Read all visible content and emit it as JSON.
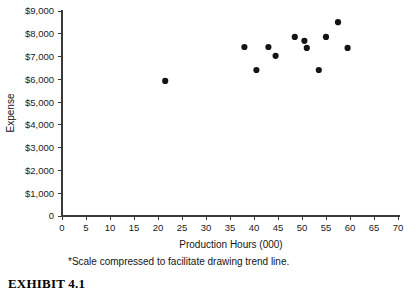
{
  "chart_data": {
    "type": "scatter",
    "title": "",
    "xlabel": "Production Hours (000)",
    "ylabel": "Expense",
    "xlim": [
      0,
      70
    ],
    "ylim": [
      0,
      9000
    ],
    "grid": false,
    "legend": null,
    "x_ticks": [
      0,
      5,
      10,
      15,
      20,
      25,
      30,
      35,
      40,
      45,
      50,
      55,
      60,
      65,
      70
    ],
    "x_tick_labels": [
      "0",
      "5",
      "10",
      "15",
      "20",
      "25",
      "30",
      "35",
      "40",
      "45",
      "50",
      "55",
      "60",
      "65",
      "70"
    ],
    "y_ticks": [
      0,
      1000,
      2000,
      3000,
      4000,
      5000,
      6000,
      7000,
      8000,
      9000
    ],
    "y_tick_labels": [
      "0",
      "$1,000",
      "$2,000",
      "$3,000",
      "$4,000",
      "$5,000",
      "$6,000",
      "$7,000",
      "$8,000",
      "$9,000"
    ],
    "points": [
      {
        "x": 21.5,
        "y": 5930
      },
      {
        "x": 38.0,
        "y": 7420
      },
      {
        "x": 40.5,
        "y": 6410
      },
      {
        "x": 43.0,
        "y": 7420
      },
      {
        "x": 44.5,
        "y": 7030
      },
      {
        "x": 48.5,
        "y": 7860
      },
      {
        "x": 50.5,
        "y": 7690
      },
      {
        "x": 51.0,
        "y": 7380
      },
      {
        "x": 53.5,
        "y": 6410
      },
      {
        "x": 55.0,
        "y": 7860
      },
      {
        "x": 57.5,
        "y": 8510
      },
      {
        "x": 59.5,
        "y": 7380
      }
    ],
    "marker": {
      "shape": "circle",
      "radius": 3.1,
      "color": "#141414"
    },
    "annotations": {
      "footnote": "*Scale compressed to facilitate drawing trend line."
    }
  },
  "exhibit": {
    "label": "EXHIBIT 4.1"
  },
  "colors": {
    "axis": "#3a3a3a",
    "marker": "#141414",
    "text": "#141414",
    "background": "#ffffff"
  }
}
